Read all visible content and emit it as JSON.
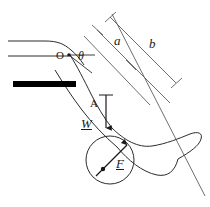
{
  "figure": {
    "type": "mechanics-free-body-diagram",
    "background_color": "#ffffff",
    "stroke_color": "#2b2b2b",
    "bar_color": "#000000",
    "labels": [
      {
        "id": "origin",
        "text": "O",
        "style": "upright",
        "x": 56,
        "y": 56,
        "size": 11
      },
      {
        "id": "angle-theta",
        "text": "θ",
        "style": "italic",
        "x": 78,
        "y": 57,
        "size": 11
      },
      {
        "id": "length-a",
        "text": "a",
        "style": "italic",
        "x": 114,
        "y": 41,
        "size": 12
      },
      {
        "id": "length-b",
        "text": "b",
        "style": "italic",
        "x": 149,
        "y": 44,
        "size": 12
      },
      {
        "id": "point-a",
        "text": "A",
        "style": "upright",
        "x": 90,
        "y": 98,
        "size": 11
      },
      {
        "id": "weight-vector",
        "text": "W",
        "style": "italic-underline",
        "x": 81,
        "y": 122,
        "size": 12
      },
      {
        "id": "force-vector",
        "text": "F",
        "style": "italic-underline",
        "x": 116,
        "y": 160,
        "size": 12
      }
    ],
    "vectors": [
      {
        "id": "weight-arrow",
        "label": "W",
        "from": [
          106,
          95
        ],
        "to": [
          106,
          132
        ],
        "direction": "down"
      },
      {
        "id": "force-arrow",
        "label": "F",
        "from": [
          102,
          171
        ],
        "to": [
          125,
          148
        ],
        "direction": "up-right"
      }
    ],
    "annotations": {
      "dimension_a": "a",
      "dimension_b": "b",
      "angle": "θ",
      "pivot_point": "O",
      "ankle_point": "A"
    }
  }
}
